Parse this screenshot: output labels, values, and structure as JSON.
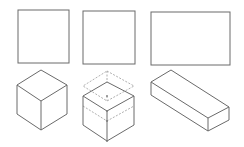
{
  "diagram": {
    "title": "",
    "stroke_color": "#6a6a6a",
    "background": "#ffffff",
    "top_row": [
      {
        "name": "square-face-1",
        "shape": "square"
      },
      {
        "name": "square-face-2",
        "shape": "square"
      },
      {
        "name": "rectangle-face",
        "shape": "rectangle"
      }
    ],
    "bottom_row": [
      {
        "name": "cube-isometric",
        "shape": "cube"
      },
      {
        "name": "cube-exploded-layers",
        "shape": "stacked cube layers"
      },
      {
        "name": "rectangular-prism",
        "shape": "cuboid"
      }
    ]
  }
}
